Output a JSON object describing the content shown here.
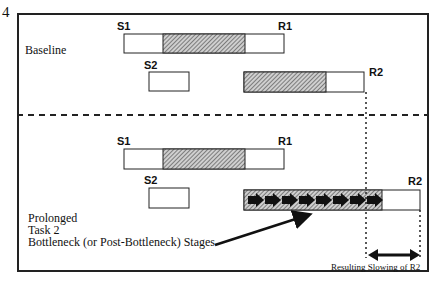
{
  "figure_number": "4",
  "panels": {
    "baseline": {
      "label": "Baseline",
      "task1": {
        "start_label": "S1",
        "end_label": "R1"
      },
      "task2": {
        "start_label": "S2",
        "end_label": "R2"
      }
    },
    "prolonged": {
      "label_lines": [
        "Prolonged",
        "Task 2",
        "Bottleneck (or Post-Bottleneck) Stages"
      ],
      "task1": {
        "start_label": "S1",
        "end_label": "R1"
      },
      "task2": {
        "start_label": "S2",
        "end_label": "R2"
      }
    }
  },
  "annotation": "Resulting Slowing of R2",
  "colors": {
    "line": "#222222",
    "hatch": "#555555",
    "background": "#ffffff"
  }
}
